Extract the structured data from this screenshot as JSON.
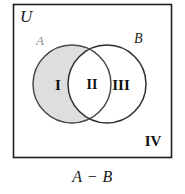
{
  "figure": {
    "universe_label": "U",
    "set_a_label": "A",
    "set_b_label": "B",
    "caption": "A − B",
    "regions": [
      {
        "id": "region-1",
        "label": "I",
        "shaded": true
      },
      {
        "id": "region-2",
        "label": "II",
        "shaded": false
      },
      {
        "id": "region-3",
        "label": "III",
        "shaded": false
      },
      {
        "id": "region-4",
        "label": "IV",
        "shaded": false
      }
    ],
    "colors": {
      "shade_fill": "#dedede",
      "circle_stroke": "#3a3a3a",
      "box_stroke": "#1f1f1f",
      "background": "#ffffff",
      "label_a_color": "#8d8d8d",
      "label_b_color": "#242424"
    },
    "geometry": {
      "box": {
        "x": 13,
        "y": 4,
        "width": 159,
        "height": 154
      },
      "circle_a": {
        "cx": 72,
        "cy": 84,
        "r": 39
      },
      "circle_b": {
        "cx": 107,
        "cy": 84,
        "r": 39
      }
    }
  }
}
